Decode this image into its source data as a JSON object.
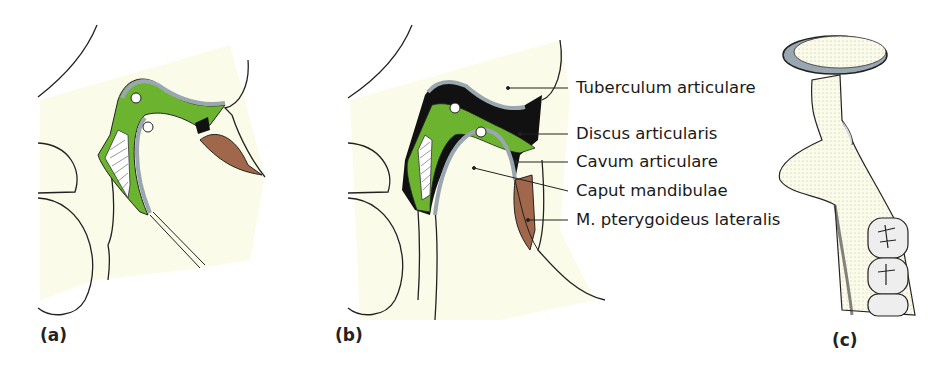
{
  "figure": {
    "panels": [
      {
        "id": "a",
        "label": "(a)"
      },
      {
        "id": "b",
        "label": "(b)"
      },
      {
        "id": "c",
        "label": "(c)"
      }
    ],
    "callouts": [
      {
        "text": "Tuberculum articulare"
      },
      {
        "text": "Discus articularis"
      },
      {
        "text": "Cavum articulare"
      },
      {
        "text": "Caput mandibulae"
      },
      {
        "text": "M. pterygoideus lateralis"
      }
    ],
    "colors": {
      "background_tint": "#fbfbe9",
      "disc_green": "#6cb330",
      "cartilage_gray": "#9aa6b0",
      "muscle_brown": "#a0674a",
      "outline": "#111111"
    }
  }
}
